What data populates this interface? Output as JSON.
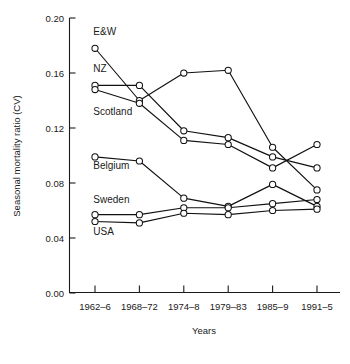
{
  "chart_data": {
    "type": "line",
    "title": "",
    "xlabel": "Years",
    "ylabel": "Seasonal mortality ratio (CV)",
    "categories": [
      "1962–6",
      "1968–72",
      "1974–8",
      "1979–83",
      "1985–9",
      "1991–5"
    ],
    "ylim": [
      0.0,
      0.2
    ],
    "yticks": [
      "0.00",
      "0.04",
      "0.08",
      "0.12",
      "0.16",
      "0.20"
    ],
    "ytick_values": [
      0.0,
      0.04,
      0.08,
      0.12,
      0.16,
      0.2
    ],
    "grid": false,
    "legend": "inline-series-labels",
    "marker": "open-circle",
    "series": [
      {
        "name": "E&W",
        "values": [
          0.178,
          0.14,
          0.16,
          0.162,
          0.106,
          0.075
        ]
      },
      {
        "name": "NZ",
        "values": [
          0.151,
          0.151,
          0.118,
          0.113,
          0.099,
          0.091
        ]
      },
      {
        "name": "Scotland",
        "values": [
          0.148,
          0.138,
          0.111,
          0.108,
          0.091,
          0.108
        ]
      },
      {
        "name": "Belgium",
        "values": [
          0.099,
          0.096,
          0.069,
          0.063,
          0.079,
          0.063
        ]
      },
      {
        "name": "Sweden",
        "values": [
          0.057,
          0.057,
          0.062,
          0.062,
          0.065,
          0.068
        ]
      },
      {
        "name": "USA",
        "values": [
          0.052,
          0.051,
          0.058,
          0.057,
          0.06,
          0.061
        ]
      }
    ],
    "series_labels": [
      {
        "text": "E&W",
        "x": 0.962,
        "y": 0.1875,
        "anchor": "start"
      },
      {
        "text": "NZ",
        "x": 0.962,
        "y": 0.1605,
        "anchor": "start"
      },
      {
        "text": "Scotland",
        "x": 0.962,
        "y": 0.1295,
        "anchor": "start"
      },
      {
        "text": "Belgium",
        "x": 0.962,
        "y": 0.0905,
        "anchor": "start"
      },
      {
        "text": "Sweden",
        "x": 0.962,
        "y": 0.0655,
        "anchor": "start"
      },
      {
        "text": "USA",
        "x": 0.962,
        "y": 0.0425,
        "anchor": "start"
      }
    ]
  }
}
